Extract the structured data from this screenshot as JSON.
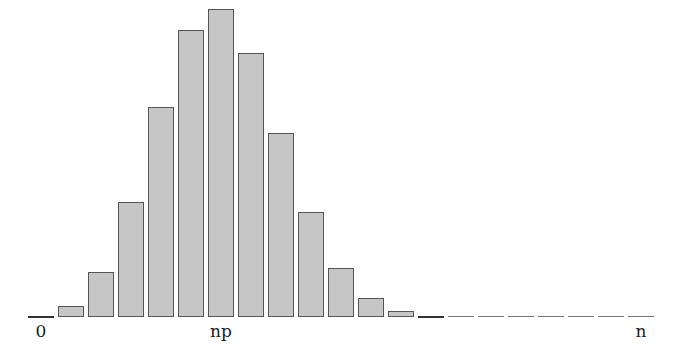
{
  "chart_data": {
    "type": "bar",
    "title": "",
    "subtitle": "",
    "xlabel": "",
    "ylabel": "",
    "categories": [
      0,
      1,
      2,
      3,
      4,
      5,
      6,
      7,
      8,
      9,
      10,
      11,
      12,
      13,
      14,
      15,
      16,
      17,
      18,
      19,
      20
    ],
    "values": [
      0.0008,
      0.0068,
      0.0278,
      0.0716,
      0.1304,
      0.1789,
      0.1916,
      0.1643,
      0.1144,
      0.0654,
      0.0308,
      0.012,
      0.0039,
      0.001,
      0.0002,
      0.0,
      0.0,
      0.0,
      0.0,
      0.0,
      0.0
    ],
    "tick_labels": [
      {
        "text": "0",
        "at_category": 0
      },
      {
        "text": "np",
        "at_category": 6
      },
      {
        "text": "n",
        "at_category": 20
      }
    ],
    "grid": false,
    "legend": null,
    "ylim": [
      0,
      0.2
    ],
    "colors": {
      "bar_fill": "#c6c6c6",
      "bar_edge": "#555555"
    }
  },
  "labels": {
    "zero": "0",
    "np": "np",
    "n": "n"
  }
}
